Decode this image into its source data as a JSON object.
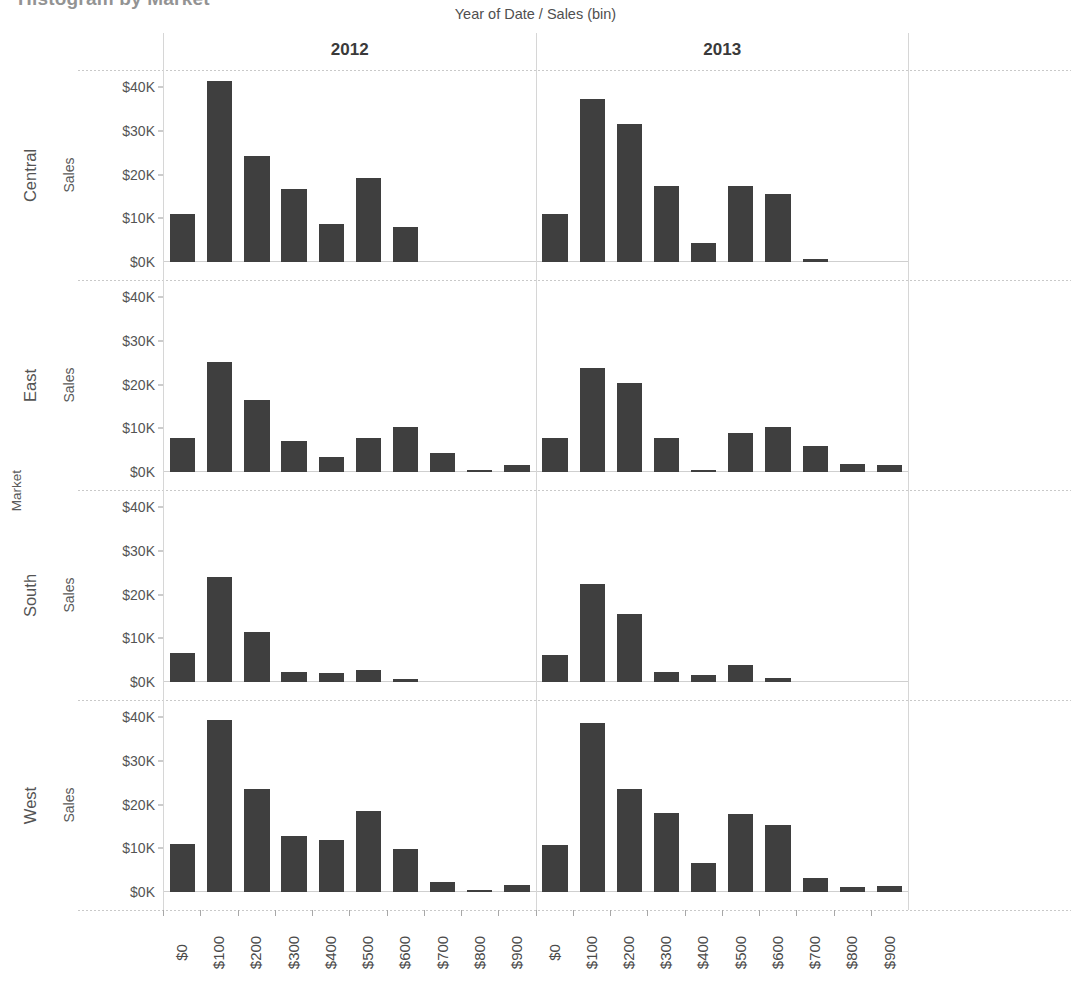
{
  "clipped_title": "Histogram by Market",
  "column_field_label": {
    "left": "Year of Date",
    "separator": "/",
    "right": "Sales (bin)"
  },
  "row_field_label": "Market",
  "axis_title": "Sales",
  "columns": [
    {
      "label": "2012"
    },
    {
      "label": "2013"
    }
  ],
  "rows": [
    {
      "label": "Central"
    },
    {
      "label": "East"
    },
    {
      "label": "South"
    },
    {
      "label": "West"
    }
  ],
  "y_ticks": [
    {
      "label": "$0K",
      "value": 0
    },
    {
      "label": "$10K",
      "value": 10000
    },
    {
      "label": "$20K",
      "value": 20000
    },
    {
      "label": "$30K",
      "value": 30000
    },
    {
      "label": "$40K",
      "value": 40000
    }
  ],
  "x_tick_labels": [
    "$0",
    "$100",
    "$200",
    "$300",
    "$400",
    "$500",
    "$600",
    "$700",
    "$800",
    "$900"
  ],
  "colors": {
    "bar": "#3f3f3f",
    "gridline": "#d6d6d6",
    "row_divider": "#c9c9c9",
    "text": "#4a4a4a",
    "background": "#ffffff"
  },
  "chart_data": {
    "type": "bar",
    "title": "Histogram by Market",
    "xlabel": "Sales (bin)",
    "ylabel": "Sales",
    "ylim": [
      0,
      44000
    ],
    "grid": false,
    "legend_position": "none",
    "facet_rows": [
      "Central",
      "East",
      "South",
      "West"
    ],
    "facet_columns": [
      "2012",
      "2013"
    ],
    "categories": [
      "$0",
      "$100",
      "$200",
      "$300",
      "$400",
      "$500",
      "$600",
      "$700",
      "$800",
      "$900"
    ],
    "panels": [
      {
        "row": "Central",
        "column": "2012",
        "values": [
          11000,
          41500,
          24200,
          16700,
          8700,
          19300,
          8100,
          0,
          0,
          0
        ]
      },
      {
        "row": "Central",
        "column": "2013",
        "values": [
          10900,
          37300,
          31600,
          17400,
          4300,
          17400,
          15700,
          600,
          0,
          0
        ]
      },
      {
        "row": "East",
        "column": "2012",
        "values": [
          7900,
          25300,
          16600,
          7000,
          3400,
          7800,
          10400,
          4300,
          400,
          1600
        ]
      },
      {
        "row": "East",
        "column": "2013",
        "values": [
          7700,
          23900,
          20500,
          7800,
          400,
          9000,
          10400,
          6000,
          1900,
          1600
        ]
      },
      {
        "row": "South",
        "column": "2012",
        "values": [
          6700,
          24100,
          11500,
          2200,
          2100,
          2800,
          700,
          0,
          0,
          0
        ]
      },
      {
        "row": "South",
        "column": "2013",
        "values": [
          6300,
          22400,
          15500,
          2200,
          1500,
          3900,
          900,
          0,
          0,
          0
        ]
      },
      {
        "row": "West",
        "column": "2012",
        "values": [
          11100,
          39500,
          23500,
          12900,
          11900,
          18500,
          9900,
          2400,
          500,
          1600
        ]
      },
      {
        "row": "West",
        "column": "2013",
        "values": [
          10800,
          38700,
          23600,
          18100,
          6700,
          17900,
          15300,
          3300,
          1200,
          1400
        ]
      }
    ]
  }
}
